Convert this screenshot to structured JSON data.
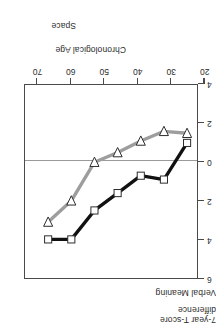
{
  "axis_captions": {
    "y_line1": "7-year T-score",
    "y_line2": "difference",
    "x_label": "Chronological Age"
  },
  "series_labels": {
    "space": "Space",
    "verbal_meaning": "Verbal Meaning"
  },
  "colors": {
    "space_line": "#111111",
    "verbal_line": "#9d9d9d",
    "marker_fill": "#ffffff",
    "frame": "#4a4a4a",
    "zero_line": "#9a9a9a"
  },
  "chart_data": {
    "type": "line",
    "title": "",
    "xlabel": "Chronological Age",
    "ylabel": "7-year T-score difference",
    "xlim": [
      22,
      74
    ],
    "ylim": [
      -4,
      6
    ],
    "xticks": [
      20,
      30,
      40,
      50,
      60,
      70
    ],
    "yticks": [
      -4,
      -2,
      0,
      2,
      4,
      6
    ],
    "grid": false,
    "zero_reference_line": 0,
    "legend": "none",
    "x": [
      25,
      32,
      39,
      46,
      53,
      60,
      67
    ],
    "series": [
      {
        "name": "Space",
        "marker": "square",
        "color": "#111111",
        "values": [
          -1.0,
          0.9,
          0.7,
          1.6,
          2.5,
          4.0,
          4.0
        ]
      },
      {
        "name": "Verbal Meaning",
        "marker": "triangle-down",
        "color": "#9d9d9d",
        "values": [
          -1.5,
          -1.6,
          -1.1,
          -0.5,
          0.0,
          2.0,
          3.1
        ]
      }
    ]
  }
}
